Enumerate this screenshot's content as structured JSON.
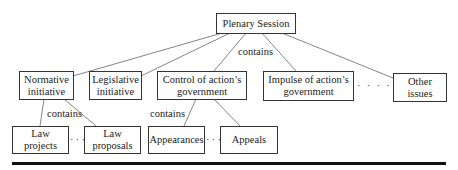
{
  "diagram": {
    "root": {
      "id": "plenary",
      "label": "Plenary Session"
    },
    "level1": [
      {
        "id": "normative",
        "label": "Normative initiative"
      },
      {
        "id": "legislative",
        "label": "Legislative initiative"
      },
      {
        "id": "control",
        "label": "Control of action’s government"
      },
      {
        "id": "impulse",
        "label": "Impulse of action’s government"
      },
      {
        "id": "other",
        "label": "Other issues"
      }
    ],
    "level2": [
      {
        "id": "law_projects",
        "label": "Law projects",
        "parent": "normative"
      },
      {
        "id": "law_proposals",
        "label": "Law proposals",
        "parent": "normative"
      },
      {
        "id": "appearances",
        "label": "Appearances",
        "parent": "control"
      },
      {
        "id": "appeals",
        "label": "Appeals",
        "parent": "control"
      }
    ],
    "edge_labels": {
      "root_contains": "contains",
      "normative_contains": "contains",
      "control_contains": "contains"
    },
    "ellipses": {
      "level1_gap": "· · · ·",
      "normative_children_gap": "· · ·",
      "control_children_gap": "· · ·"
    },
    "colors": {
      "line": "#666666",
      "border": "#333333",
      "rule": "#111111"
    }
  }
}
